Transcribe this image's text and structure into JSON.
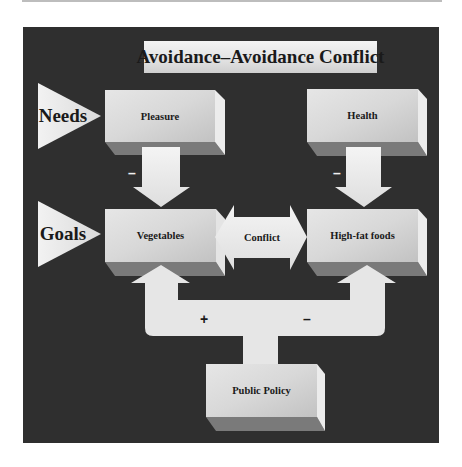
{
  "title": "Avoidance–Avoidance Conflict",
  "side_labels": {
    "needs": "Needs",
    "goals": "Goals"
  },
  "boxes": {
    "pleasure": "Pleasure",
    "health": "Health",
    "vegetables": "Vegetables",
    "high_fat_foods": "High-fat foods",
    "public_policy": "Public Policy"
  },
  "conflict_arrow": {
    "label": "Conflict"
  },
  "signs": {
    "pleasure_to_vegetables": "–",
    "health_to_high_fat": "–",
    "policy_to_vegetables": "+",
    "policy_to_high_fat": "–"
  },
  "colors": {
    "background": "#2f2f2f",
    "box_front": "#dcdcdc",
    "box_side": "#e8e8e8",
    "box_bottom": "#7a7a7a",
    "arrow_fill": "#ececec"
  }
}
